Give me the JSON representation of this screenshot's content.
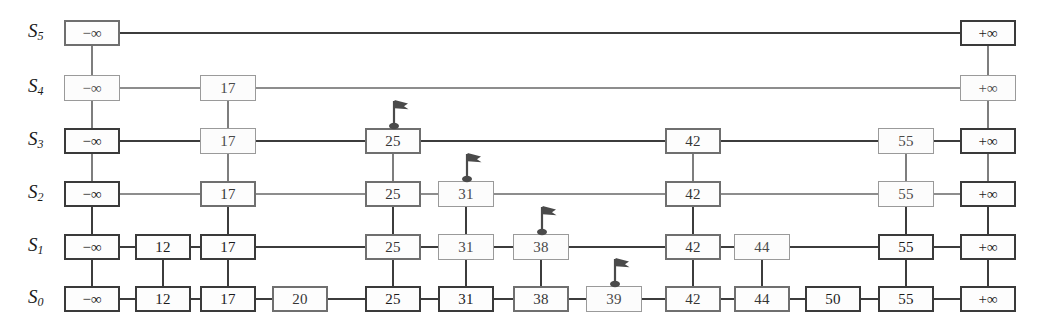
{
  "diagram": {
    "type": "skip-list",
    "width": 1040,
    "height": 328,
    "neg_inf": "−∞",
    "pos_inf": "+∞",
    "colors": {
      "node_border_dark": "#3a3a3a",
      "node_border_mid": "#6f6f6f",
      "node_border_light": "#9a9a9a",
      "link_dark": "#3c3c3c",
      "link_light": "#8d8d8d",
      "background": "#ffffff",
      "text": "#1b1b1b"
    },
    "row_labels": [
      {
        "name": "S",
        "sub": "5"
      },
      {
        "name": "S",
        "sub": "4"
      },
      {
        "name": "S",
        "sub": "3"
      },
      {
        "name": "S",
        "sub": "2"
      },
      {
        "name": "S",
        "sub": "1"
      },
      {
        "name": "S",
        "sub": "0"
      }
    ],
    "levels": [
      {
        "label": "S5",
        "y": 33,
        "weight": "dark",
        "nodes": [
          {
            "value": "−∞",
            "x": 92,
            "flag": false,
            "style": "mid"
          },
          {
            "value": "+∞",
            "x": 988,
            "flag": false,
            "style": "dark"
          }
        ]
      },
      {
        "label": "S4",
        "y": 88,
        "weight": "light",
        "nodes": [
          {
            "value": "−∞",
            "x": 92,
            "flag": false,
            "style": "light"
          },
          {
            "value": "17",
            "x": 228,
            "flag": false,
            "style": "light"
          },
          {
            "value": "+∞",
            "x": 988,
            "flag": false,
            "style": "light"
          }
        ]
      },
      {
        "label": "S3",
        "y": 141,
        "weight": "mid",
        "nodes": [
          {
            "value": "−∞",
            "x": 92,
            "flag": false,
            "style": "dark"
          },
          {
            "value": "17",
            "x": 228,
            "flag": false,
            "style": "light"
          },
          {
            "value": "25",
            "x": 393,
            "flag": true,
            "style": "mid"
          },
          {
            "value": "42",
            "x": 693,
            "flag": false,
            "style": "mid"
          },
          {
            "value": "55",
            "x": 906,
            "flag": false,
            "style": "light"
          },
          {
            "value": "+∞",
            "x": 988,
            "flag": false,
            "style": "dark"
          }
        ]
      },
      {
        "label": "S2",
        "y": 194,
        "weight": "light",
        "nodes": [
          {
            "value": "−∞",
            "x": 92,
            "flag": false,
            "style": "dark"
          },
          {
            "value": "17",
            "x": 228,
            "flag": false,
            "style": "mid"
          },
          {
            "value": "25",
            "x": 393,
            "flag": false,
            "style": "mid"
          },
          {
            "value": "31",
            "x": 466,
            "flag": true,
            "style": "light"
          },
          {
            "value": "42",
            "x": 693,
            "flag": false,
            "style": "mid"
          },
          {
            "value": "55",
            "x": 906,
            "flag": false,
            "style": "light"
          },
          {
            "value": "+∞",
            "x": 988,
            "flag": false,
            "style": "dark"
          }
        ]
      },
      {
        "label": "S1",
        "y": 247,
        "weight": "dark",
        "nodes": [
          {
            "value": "−∞",
            "x": 92,
            "flag": false,
            "style": "dark"
          },
          {
            "value": "12",
            "x": 163,
            "flag": false,
            "style": "dark"
          },
          {
            "value": "17",
            "x": 228,
            "flag": false,
            "style": "dark"
          },
          {
            "value": "25",
            "x": 393,
            "flag": false,
            "style": "mid"
          },
          {
            "value": "31",
            "x": 466,
            "flag": false,
            "style": "light"
          },
          {
            "value": "38",
            "x": 541,
            "flag": true,
            "style": "light"
          },
          {
            "value": "42",
            "x": 693,
            "flag": false,
            "style": "mid"
          },
          {
            "value": "44",
            "x": 762,
            "flag": false,
            "style": "light"
          },
          {
            "value": "55",
            "x": 906,
            "flag": false,
            "style": "dark"
          },
          {
            "value": "+∞",
            "x": 988,
            "flag": false,
            "style": "dark"
          }
        ]
      },
      {
        "label": "S0",
        "y": 299,
        "weight": "dark",
        "nodes": [
          {
            "value": "−∞",
            "x": 92,
            "flag": false,
            "style": "dark"
          },
          {
            "value": "12",
            "x": 163,
            "flag": false,
            "style": "dark"
          },
          {
            "value": "17",
            "x": 228,
            "flag": false,
            "style": "dark"
          },
          {
            "value": "20",
            "x": 300,
            "flag": false,
            "style": "mid"
          },
          {
            "value": "25",
            "x": 393,
            "flag": false,
            "style": "dark"
          },
          {
            "value": "31",
            "x": 466,
            "flag": false,
            "style": "dark"
          },
          {
            "value": "38",
            "x": 541,
            "flag": false,
            "style": "mid"
          },
          {
            "value": "39",
            "x": 614,
            "flag": true,
            "style": "light"
          },
          {
            "value": "42",
            "x": 693,
            "flag": false,
            "style": "mid"
          },
          {
            "value": "44",
            "x": 762,
            "flag": false,
            "style": "mid"
          },
          {
            "value": "50",
            "x": 833,
            "flag": false,
            "style": "dark"
          },
          {
            "value": "55",
            "x": 906,
            "flag": false,
            "style": "dark"
          },
          {
            "value": "+∞",
            "x": 988,
            "flag": false,
            "style": "dark"
          }
        ]
      }
    ],
    "flag_marker_name": "search-position-flag"
  }
}
